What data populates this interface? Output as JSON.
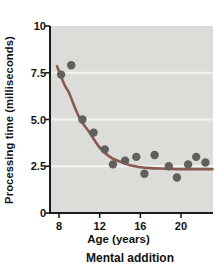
{
  "chart_data": {
    "type": "scatter",
    "title": "",
    "xlabel": "Age (years)",
    "ylabel": "Processing time (milliseconds)",
    "caption": "Mental addition",
    "xlim": [
      7.11,
      23.15
    ],
    "ylim": [
      0,
      10
    ],
    "xticks": [
      8,
      12,
      16,
      20
    ],
    "xtick_labels": [
      "8",
      "12",
      "16",
      "20"
    ],
    "yticks": [
      0,
      2.5,
      5.0,
      7.5,
      10
    ],
    "ytick_labels": [
      "0",
      "2.5",
      "5.0",
      "7.5",
      "10"
    ],
    "gridline_values": [
      2.5,
      5.0,
      7.5
    ],
    "grid": "horizontal white lines",
    "legend": "none",
    "points": [
      [
        8.2,
        7.4
      ],
      [
        9.2,
        7.9
      ],
      [
        10.3,
        5.0
      ],
      [
        11.4,
        4.3
      ],
      [
        12.5,
        3.4
      ],
      [
        13.3,
        2.6
      ],
      [
        14.5,
        2.8
      ],
      [
        15.6,
        3.0
      ],
      [
        16.4,
        2.1
      ],
      [
        17.4,
        3.1
      ],
      [
        18.8,
        2.5
      ],
      [
        19.6,
        1.9
      ],
      [
        20.7,
        2.6
      ],
      [
        21.5,
        3.0
      ],
      [
        22.4,
        2.7
      ]
    ],
    "trend_curve": [
      [
        7.8,
        7.85
      ],
      [
        8.5,
        6.9
      ],
      [
        9.0,
        6.4
      ],
      [
        10.0,
        5.1
      ],
      [
        11.0,
        4.3
      ],
      [
        12.0,
        3.5
      ],
      [
        13.0,
        3.0
      ],
      [
        14.0,
        2.75
      ],
      [
        15.0,
        2.55
      ],
      [
        16.0,
        2.45
      ],
      [
        17.0,
        2.4
      ],
      [
        18.5,
        2.37
      ],
      [
        20.0,
        2.35
      ],
      [
        23.1,
        2.35
      ]
    ],
    "colors": {
      "plot_bg": "#dcdcd9",
      "gridline": "#f4f4f1",
      "axis": "#1c1c1c",
      "point": "#61605c",
      "curve": "#8a5a50",
      "text": "#121212",
      "page_bg": "#ffffff"
    }
  }
}
